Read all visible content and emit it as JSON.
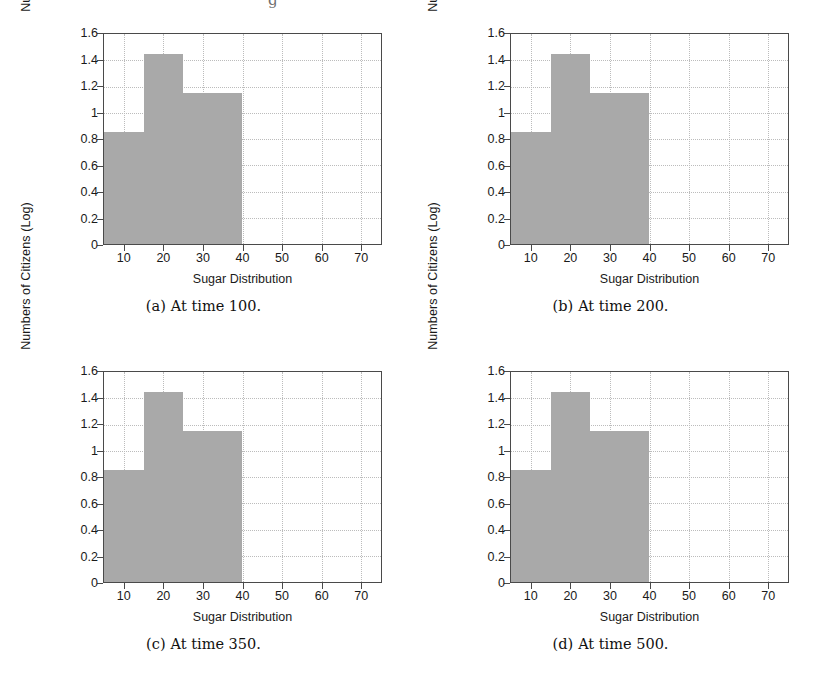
{
  "figure": {
    "panels": [
      {
        "caption_tag": "(a)",
        "caption_text": "At time 100.",
        "chart_data": {
          "type": "bar",
          "title": "",
          "subtitle": "",
          "xlabel": "Sugar Distribution",
          "ylabel": "Numbers of Citizens (Log)",
          "xlim": [
            5,
            75
          ],
          "ylim": [
            0,
            1.6
          ],
          "xticks": [
            10,
            20,
            30,
            40,
            50,
            60,
            70
          ],
          "xtick_labels": [
            "10",
            "20",
            "30",
            "40",
            "50",
            "60",
            "70"
          ],
          "yticks": [
            0,
            0.2,
            0.4,
            0.6,
            0.8,
            1,
            1.2,
            1.4,
            1.6
          ],
          "ytick_labels": [
            "0",
            "0.2",
            "0.4",
            "0.6",
            "0.8",
            "1",
            "1.2",
            "1.4",
            "1.6"
          ],
          "grid": true,
          "legend": "none",
          "bar_color": "#a9a9a9",
          "bins": [
            {
              "x0": 5,
              "x1": 15,
              "value": 0.85
            },
            {
              "x0": 15,
              "x1": 25,
              "value": 1.45
            },
            {
              "x0": 25,
              "x1": 40,
              "value": 1.15
            }
          ]
        }
      },
      {
        "caption_tag": "(b)",
        "caption_text": "At time 200.",
        "chart_data": {
          "type": "bar",
          "title": "",
          "subtitle": "",
          "xlabel": "Sugar Distribution",
          "ylabel": "Numbers of Citizens (Log)",
          "xlim": [
            5,
            75
          ],
          "ylim": [
            0,
            1.6
          ],
          "xticks": [
            10,
            20,
            30,
            40,
            50,
            60,
            70
          ],
          "xtick_labels": [
            "10",
            "20",
            "30",
            "40",
            "50",
            "60",
            "70"
          ],
          "yticks": [
            0,
            0.2,
            0.4,
            0.6,
            0.8,
            1,
            1.2,
            1.4,
            1.6
          ],
          "ytick_labels": [
            "0",
            "0.2",
            "0.4",
            "0.6",
            "0.8",
            "1",
            "1.2",
            "1.4",
            "1.6"
          ],
          "grid": true,
          "legend": "none",
          "bar_color": "#a9a9a9",
          "bins": [
            {
              "x0": 5,
              "x1": 15,
              "value": 0.85
            },
            {
              "x0": 15,
              "x1": 25,
              "value": 1.45
            },
            {
              "x0": 25,
              "x1": 40,
              "value": 1.15
            }
          ]
        }
      },
      {
        "caption_tag": "(c)",
        "caption_text": "At time 350.",
        "chart_data": {
          "type": "bar",
          "title": "",
          "subtitle": "",
          "xlabel": "Sugar Distribution",
          "ylabel": "Numbers of Citizens (Log)",
          "xlim": [
            5,
            75
          ],
          "ylim": [
            0,
            1.6
          ],
          "xticks": [
            10,
            20,
            30,
            40,
            50,
            60,
            70
          ],
          "xtick_labels": [
            "10",
            "20",
            "30",
            "40",
            "50",
            "60",
            "70"
          ],
          "yticks": [
            0,
            0.2,
            0.4,
            0.6,
            0.8,
            1,
            1.2,
            1.4,
            1.6
          ],
          "ytick_labels": [
            "0",
            "0.2",
            "0.4",
            "0.6",
            "0.8",
            "1",
            "1.2",
            "1.4",
            "1.6"
          ],
          "grid": true,
          "legend": "none",
          "bar_color": "#a9a9a9",
          "bins": [
            {
              "x0": 5,
              "x1": 15,
              "value": 0.85
            },
            {
              "x0": 15,
              "x1": 25,
              "value": 1.45
            },
            {
              "x0": 25,
              "x1": 40,
              "value": 1.15
            }
          ]
        }
      },
      {
        "caption_tag": "(d)",
        "caption_text": "At time 500.",
        "chart_data": {
          "type": "bar",
          "title": "",
          "subtitle": "",
          "xlabel": "Sugar Distribution",
          "ylabel": "Numbers of Citizens (Log)",
          "xlim": [
            5,
            75
          ],
          "ylim": [
            0,
            1.6
          ],
          "xticks": [
            10,
            20,
            30,
            40,
            50,
            60,
            70
          ],
          "xtick_labels": [
            "10",
            "20",
            "30",
            "40",
            "50",
            "60",
            "70"
          ],
          "yticks": [
            0,
            0.2,
            0.4,
            0.6,
            0.8,
            1,
            1.2,
            1.4,
            1.6
          ],
          "ytick_labels": [
            "0",
            "0.2",
            "0.4",
            "0.6",
            "0.8",
            "1",
            "1.2",
            "1.4",
            "1.6"
          ],
          "grid": true,
          "legend": "none",
          "bar_color": "#a9a9a9",
          "bins": [
            {
              "x0": 5,
              "x1": 15,
              "value": 0.85
            },
            {
              "x0": 15,
              "x1": 25,
              "value": 1.45
            },
            {
              "x0": 25,
              "x1": 40,
              "value": 1.15
            }
          ]
        }
      }
    ],
    "top_cut_glyph": "g"
  },
  "chart_data": [
    {
      "type": "bar",
      "title": "(a) At time 100.",
      "xlabel": "Sugar Distribution",
      "ylabel": "Numbers of Citizens (Log)",
      "categories": [
        "5-15",
        "15-25",
        "25-40"
      ],
      "values": [
        0.85,
        1.45,
        1.15
      ],
      "xlim": [
        5,
        75
      ],
      "ylim": [
        0,
        1.6
      ],
      "grid": true,
      "legend": "none"
    },
    {
      "type": "bar",
      "title": "(b) At time 200.",
      "xlabel": "Sugar Distribution",
      "ylabel": "Numbers of Citizens (Log)",
      "categories": [
        "5-15",
        "15-25",
        "25-40"
      ],
      "values": [
        0.85,
        1.45,
        1.15
      ],
      "xlim": [
        5,
        75
      ],
      "ylim": [
        0,
        1.6
      ],
      "grid": true,
      "legend": "none"
    },
    {
      "type": "bar",
      "title": "(c) At time 350.",
      "xlabel": "Sugar Distribution",
      "ylabel": "Numbers of Citizens (Log)",
      "categories": [
        "5-15",
        "15-25",
        "25-40"
      ],
      "values": [
        0.85,
        1.45,
        1.15
      ],
      "xlim": [
        5,
        75
      ],
      "ylim": [
        0,
        1.6
      ],
      "grid": true,
      "legend": "none"
    },
    {
      "type": "bar",
      "title": "(d) At time 500.",
      "xlabel": "Sugar Distribution",
      "ylabel": "Numbers of Citizens (Log)",
      "categories": [
        "5-15",
        "15-25",
        "25-40"
      ],
      "values": [
        0.85,
        1.45,
        1.15
      ],
      "xlim": [
        5,
        75
      ],
      "ylim": [
        0,
        1.6
      ],
      "grid": true,
      "legend": "none"
    }
  ]
}
